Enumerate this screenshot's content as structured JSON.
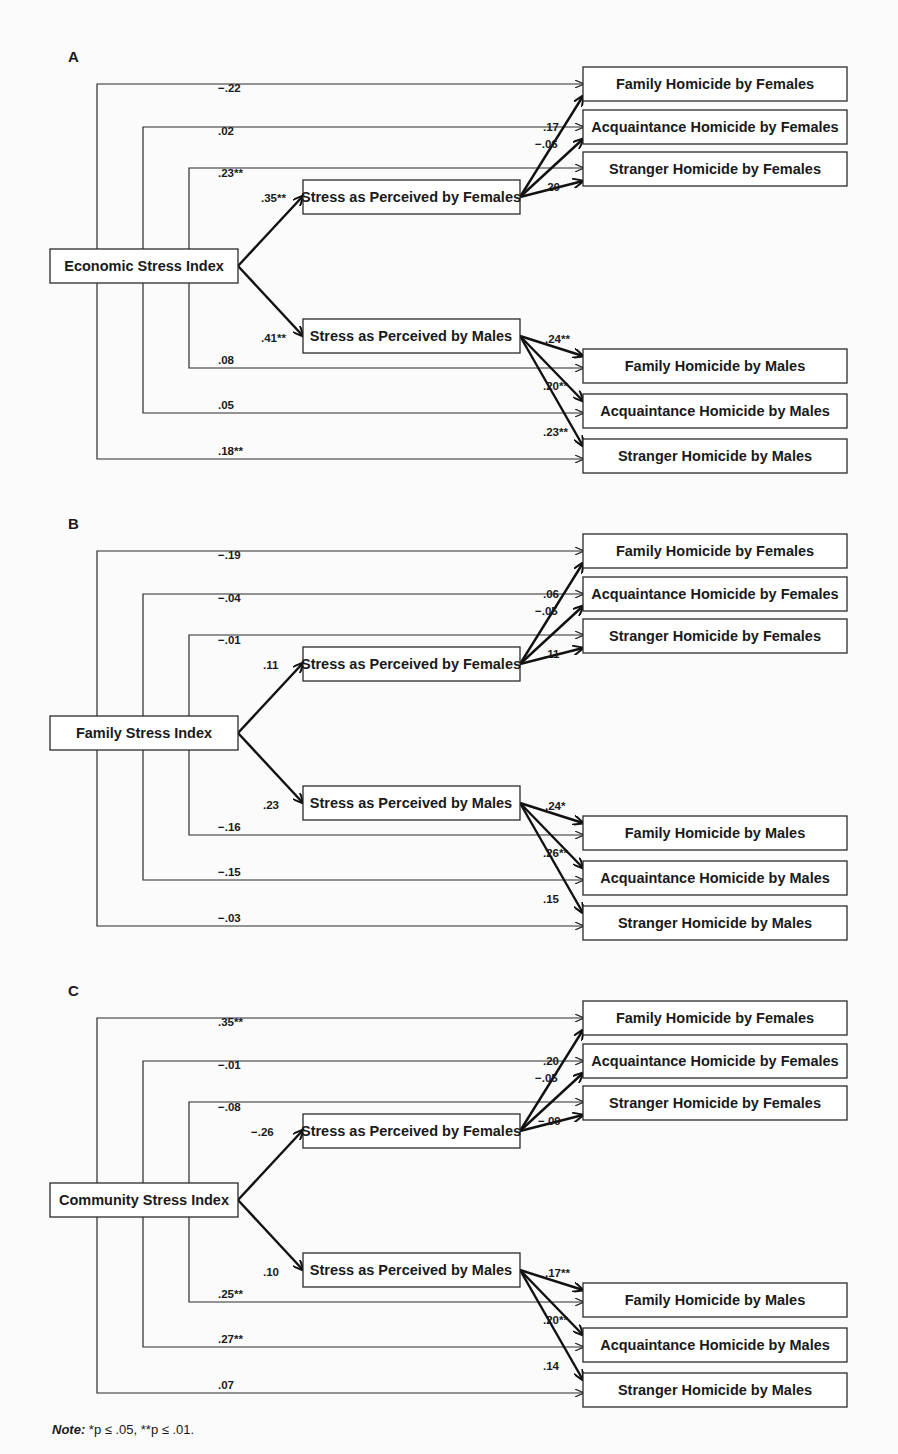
{
  "figure": {
    "note_label": "Note:",
    "note_text": " *p ≤ .05, **p ≤ .01.",
    "panels": [
      {
        "label": "A",
        "predictor": "Economic Stress Index",
        "mediators": [
          "Stress as Perceived by Females",
          "Stress as Perceived by Males"
        ],
        "outcomes_female": [
          "Family Homicide by Females",
          "Acquaintance Homicide by Females",
          "Stranger Homicide by Females"
        ],
        "outcomes_male": [
          "Family Homicide by Males",
          "Acquaintance Homicide by Males",
          "Stranger Homicide by Males"
        ],
        "direct_female": [
          "−.22",
          ".02",
          ".23**"
        ],
        "direct_male": [
          ".08",
          ".05",
          ".18**"
        ],
        "predictor_to_mediator": [
          ".35**",
          ".41**"
        ],
        "female_mediator_to_outcomes": [
          ".17",
          "−.06",
          ".20"
        ],
        "male_mediator_to_outcomes": [
          ".24**",
          ".20**",
          ".23**"
        ]
      },
      {
        "label": "B",
        "predictor": "Family Stress Index",
        "mediators": [
          "Stress as Perceived by Females",
          "Stress as Perceived by Males"
        ],
        "outcomes_female": [
          "Family Homicide by Females",
          "Acquaintance Homicide by Females",
          "Stranger Homicide by Females"
        ],
        "outcomes_male": [
          "Family Homicide by Males",
          "Acquaintance Homicide by Males",
          "Stranger Homicide by Males"
        ],
        "direct_female": [
          "−.19",
          "−.04",
          "−.01"
        ],
        "direct_male": [
          "−.16",
          "−.15",
          "−.03"
        ],
        "predictor_to_mediator": [
          ".11",
          ".23"
        ],
        "female_mediator_to_outcomes": [
          ".06",
          "−.05",
          ".11"
        ],
        "male_mediator_to_outcomes": [
          ".24*",
          ".26**",
          ".15"
        ]
      },
      {
        "label": "C",
        "predictor": "Community Stress Index",
        "mediators": [
          "Stress as Perceived by Females",
          "Stress as Perceived by Males"
        ],
        "outcomes_female": [
          "Family Homicide by Females",
          "Acquaintance Homicide by Females",
          "Stranger Homicide by Females"
        ],
        "outcomes_male": [
          "Family Homicide by Males",
          "Acquaintance Homicide by Males",
          "Stranger Homicide by Males"
        ],
        "direct_female": [
          ".35**",
          "−.01",
          "−.08"
        ],
        "direct_male": [
          ".25**",
          ".27**",
          ".07"
        ],
        "predictor_to_mediator": [
          "−.26",
          ".10"
        ],
        "female_mediator_to_outcomes": [
          ".20",
          "−.05",
          "−.09"
        ],
        "male_mediator_to_outcomes": [
          ".17**",
          ".20**",
          ".14"
        ]
      }
    ]
  }
}
